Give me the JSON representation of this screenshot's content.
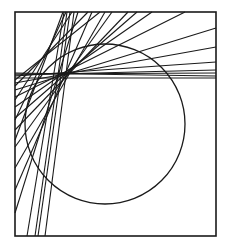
{
  "diagram": {
    "title": "",
    "stroke_color": "#1a1a1a",
    "background": "#ffffff",
    "frame": {
      "x": 15,
      "y": 12,
      "width": 201,
      "height": 224,
      "stroke_width": 1.6
    },
    "circle": {
      "cx": 105,
      "cy": 124,
      "r": 80,
      "stroke_width": 1.3
    },
    "line_stroke_width": 1.1,
    "lines": [
      [
        27,
        236,
        64,
        12
      ],
      [
        35,
        236,
        67,
        12
      ],
      [
        38,
        236,
        70,
        12
      ],
      [
        45,
        236,
        74,
        12
      ],
      [
        15,
        213,
        78,
        12
      ],
      [
        15,
        190,
        92,
        12
      ],
      [
        15,
        168,
        105,
        12
      ],
      [
        15,
        147,
        112,
        12
      ],
      [
        15,
        130,
        128,
        12
      ],
      [
        15,
        118,
        137,
        12
      ],
      [
        15,
        107,
        152,
        12
      ],
      [
        15,
        97,
        185,
        12
      ],
      [
        15,
        90,
        216,
        28
      ],
      [
        15,
        83,
        216,
        47
      ],
      [
        15,
        76,
        216,
        62
      ],
      [
        15,
        75,
        216,
        70
      ],
      [
        15,
        74,
        216,
        73
      ],
      [
        15,
        73,
        216,
        76
      ],
      [
        15,
        78,
        216,
        78
      ],
      [
        15,
        140,
        63,
        12
      ],
      [
        15,
        120,
        66,
        12
      ],
      [
        15,
        100,
        72,
        12
      ],
      [
        15,
        86,
        88,
        12
      ],
      [
        15,
        80,
        100,
        12
      ]
    ]
  }
}
